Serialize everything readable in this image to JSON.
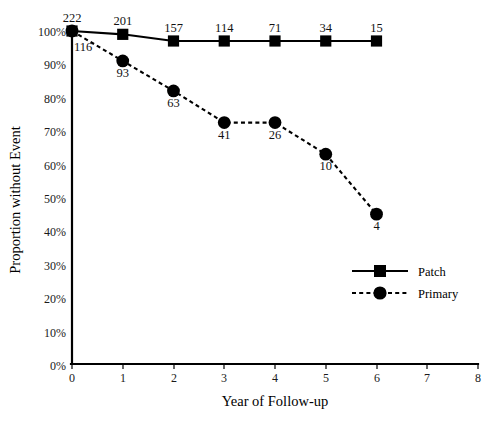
{
  "chart_data": {
    "type": "line",
    "title": "",
    "xlabel": "Year of Follow-up",
    "ylabel": "Proportion without Event",
    "x": [
      0,
      1,
      2,
      3,
      4,
      5,
      6
    ],
    "xlim": [
      0,
      8
    ],
    "ylim": [
      0,
      100
    ],
    "xticks": [
      "0",
      "1",
      "2",
      "3",
      "4",
      "5",
      "6",
      "7",
      "8"
    ],
    "yticks": [
      "0%",
      "10%",
      "20%",
      "30%",
      "40%",
      "50%",
      "60%",
      "70%",
      "80%",
      "90%",
      "100%"
    ],
    "grid": false,
    "legend_position": "center-right",
    "series": [
      {
        "name": "Patch",
        "marker": "square",
        "linestyle": "solid",
        "values": [
          100,
          99,
          97,
          97,
          97,
          97,
          97
        ],
        "point_labels": [
          "222",
          "201",
          "157",
          "114",
          "71",
          "34",
          "15"
        ]
      },
      {
        "name": "Primary",
        "marker": "circle",
        "linestyle": "dotted",
        "values": [
          100,
          91,
          82,
          72.5,
          72.5,
          63,
          45
        ],
        "point_labels": [
          "116",
          "93",
          "63",
          "41",
          "26",
          "10",
          "4"
        ]
      }
    ]
  },
  "legend": {
    "entries": [
      {
        "label": "Patch"
      },
      {
        "label": "Primary"
      }
    ]
  },
  "axes": {
    "x_title": "Year of Follow-up",
    "y_title": "Proportion without Event"
  }
}
